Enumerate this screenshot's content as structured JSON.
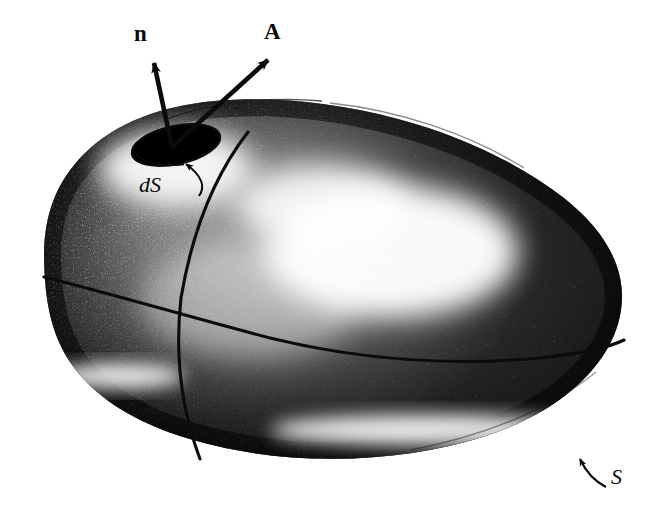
{
  "figure": {
    "kind": "vector-field-flux-through-closed-surface",
    "background_color": "#ffffff",
    "ink_color": "#0b0b0b"
  },
  "labels": {
    "normal_vector": "n",
    "field_vector": "A",
    "area_element": "dS",
    "surface": "S"
  },
  "annotations": {
    "n_arrow": {
      "label": "n",
      "from": [
        172,
        146
      ],
      "to": [
        152,
        57
      ]
    },
    "A_arrow": {
      "label": "A",
      "from": [
        172,
        146
      ],
      "to": [
        274,
        54
      ]
    },
    "dS_leader": {
      "label": "dS",
      "from": [
        200,
        193
      ],
      "to": [
        184,
        157
      ]
    },
    "S_leader": {
      "label": "S",
      "from": [
        607,
        486
      ],
      "to": [
        576,
        452
      ]
    }
  },
  "surface": {
    "name": "closed-surface-S",
    "outline_points": [
      [
        44,
        252
      ],
      [
        48,
        205
      ],
      [
        66,
        168
      ],
      [
        98,
        137
      ],
      [
        140,
        116
      ],
      [
        196,
        104
      ],
      [
        262,
        100
      ],
      [
        330,
        105
      ],
      [
        400,
        120
      ],
      [
        470,
        146
      ],
      [
        532,
        180
      ],
      [
        578,
        216
      ],
      [
        608,
        254
      ],
      [
        622,
        292
      ],
      [
        620,
        330
      ],
      [
        600,
        372
      ],
      [
        560,
        408
      ],
      [
        504,
        434
      ],
      [
        436,
        450
      ],
      [
        360,
        457
      ],
      [
        286,
        455
      ],
      [
        220,
        446
      ],
      [
        166,
        430
      ],
      [
        126,
        410
      ],
      [
        96,
        388
      ],
      [
        74,
        362
      ],
      [
        58,
        330
      ],
      [
        48,
        296
      ]
    ]
  },
  "area_element_patch": {
    "name": "dS-patch",
    "center": [
      176,
      145
    ],
    "rx": 45,
    "ry": 19,
    "rotation_deg": -12,
    "shade": "dark-stipple"
  },
  "surface_curves": [
    {
      "name": "meridian-curve",
      "points": [
        [
          246,
          133
        ],
        [
          212,
          180
        ],
        [
          190,
          235
        ],
        [
          180,
          300
        ],
        [
          184,
          370
        ],
        [
          196,
          432
        ],
        [
          206,
          458
        ]
      ]
    },
    {
      "name": "equator-curve",
      "points": [
        [
          44,
          280
        ],
        [
          110,
          296
        ],
        [
          180,
          315
        ],
        [
          262,
          337
        ],
        [
          352,
          352
        ],
        [
          450,
          360
        ],
        [
          540,
          358
        ],
        [
          604,
          348
        ],
        [
          624,
          340
        ]
      ]
    }
  ],
  "highlights": [
    {
      "name": "main-highlight",
      "center": [
        390,
        255
      ],
      "rx": 120,
      "ry": 62
    },
    {
      "name": "rim-highlight",
      "center": [
        420,
        432
      ],
      "rx": 150,
      "ry": 14
    },
    {
      "name": "left-rim-highlight",
      "center": [
        110,
        378
      ],
      "rx": 62,
      "ry": 12
    }
  ]
}
